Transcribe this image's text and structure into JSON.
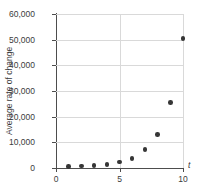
{
  "chart_data": {
    "type": "scatter",
    "title": "",
    "xlabel": "t",
    "ylabel": "Average rate of change",
    "xlim": [
      0,
      10
    ],
    "ylim": [
      0,
      60000
    ],
    "grid": true,
    "legend": null,
    "x_ticks": [
      "0",
      "5",
      "10"
    ],
    "x_tick_values": [
      0,
      5,
      10
    ],
    "y_ticks": [
      "0",
      "10,000",
      "20,000",
      "30,000",
      "40,000",
      "50,000",
      "60,000"
    ],
    "y_tick_values": [
      0,
      10000,
      20000,
      30000,
      40000,
      50000,
      60000
    ],
    "x": [
      1,
      2,
      3,
      4,
      5,
      6,
      7,
      8,
      9,
      10
    ],
    "values": [
      600,
      800,
      1000,
      1400,
      2400,
      3600,
      7100,
      13000,
      25500,
      50500
    ],
    "marker_color": "#363636",
    "grid_color": "#d9d9d9",
    "axis_color": "#4d4d4d"
  }
}
